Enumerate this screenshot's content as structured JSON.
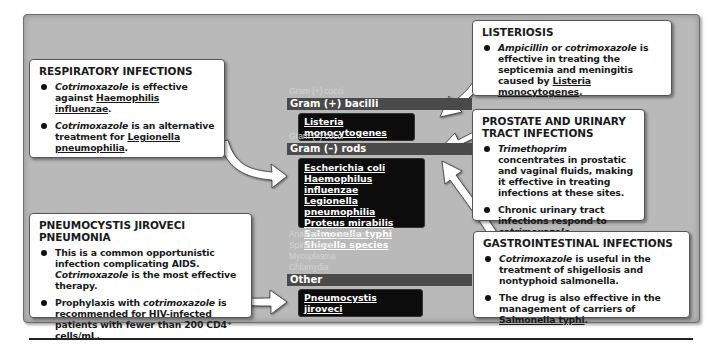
{
  "diagram": {
    "respiratory": {
      "title": "RESPIRATORY INFECTIONS",
      "bullets": [
        {
          "parts": [
            {
              "t": "Cotrimoxazole",
              "i": true
            },
            {
              "t": " is effective against "
            },
            {
              "t": "Haemophilis",
              "u": true
            },
            {
              "t": " "
            },
            {
              "t": "influenzae",
              "u": true
            },
            {
              "t": "."
            }
          ]
        },
        {
          "parts": [
            {
              "t": "Cotrimoxazole",
              "i": true
            },
            {
              "t": " is an alternative treatment for "
            },
            {
              "t": "Legionella pneumophilia",
              "u": true
            },
            {
              "t": "."
            }
          ]
        }
      ]
    },
    "pneumocystis": {
      "title": "PNEUMOCYSTIS JIROVECI PNEUMONIA",
      "bullets": [
        {
          "parts": [
            {
              "t": "This is a common opportunistic infection complicating AIDS. "
            },
            {
              "t": "Cotrimoxazole",
              "i": true
            },
            {
              "t": " is the most effective therapy."
            }
          ]
        },
        {
          "parts": [
            {
              "t": "Prophylaxis with "
            },
            {
              "t": "cotrimoxazole",
              "i": true
            },
            {
              "t": " is recommended for HIV-infected patients with fewer than 200 CD4⁺ cells/mL."
            }
          ]
        }
      ]
    },
    "listeriosis": {
      "title": "LISTERIOSIS",
      "bullets": [
        {
          "parts": [
            {
              "t": "Ampicillin",
              "i": true
            },
            {
              "t": " or "
            },
            {
              "t": "cotrimoxazole",
              "i": true
            },
            {
              "t": " is effective in treating the septicemia and meningitis caused by "
            },
            {
              "t": "Listeria monocytogenes",
              "u": true
            },
            {
              "t": "."
            }
          ]
        }
      ]
    },
    "prostate": {
      "title": "PROSTATE AND URINARY TRACT INFECTIONS",
      "bullets": [
        {
          "parts": [
            {
              "t": "Trimethoprim",
              "i": true
            },
            {
              "t": " concentrates in prostatic and vaginal fluids, making it effective in treating infections at these sites."
            }
          ]
        },
        {
          "parts": [
            {
              "t": "Chronic urinary tract infections respond to "
            },
            {
              "t": "cotrimoxazole",
              "i": true
            },
            {
              "t": "."
            }
          ]
        }
      ]
    },
    "gastro": {
      "title": "GASTROINTESTINAL INFECTIONS",
      "bullets": [
        {
          "parts": [
            {
              "t": "Cotrimoxazole",
              "i": true
            },
            {
              "t": " is useful in the treatment of shigellosis and nontyphoid salmonella."
            }
          ]
        },
        {
          "parts": [
            {
              "t": "The drug is also effective in the management of carriers of "
            },
            {
              "t": "Salmonella typhi",
              "u": true
            },
            {
              "t": "."
            }
          ]
        }
      ]
    },
    "organism_list": {
      "gram_pos_cocci": "Gram (+) cocci",
      "gram_pos_bacilli": "Gram (+) bacilli",
      "gram_pos_bacilli_items": [
        "Listeria monocytogenes"
      ],
      "gram_neg_cocci": "Gram (–) cocci",
      "gram_neg_rods": "Gram (–) rods",
      "gram_neg_rods_items": [
        "Escherichia coli",
        "Haemophilus influenzae",
        "Legionella pneumophilia",
        "Proteus mirabilis",
        "Salmonella typhi",
        "Shigella species"
      ],
      "anaerobic": "Anaerobic organisms",
      "spirochetes": "Spirochetes",
      "mycoplasma": "Mycoplasma",
      "chlamydia": "Chlamydia",
      "other": "Other",
      "other_items": [
        "Pneumocystis jiroveci"
      ]
    },
    "colors": {
      "panel": "#b9b9b9",
      "header_bar": "#4a4a4a",
      "organism_box": "#0c0c0c",
      "faint_text": "#d3d3d3",
      "callout_box": "#ffffff"
    }
  }
}
